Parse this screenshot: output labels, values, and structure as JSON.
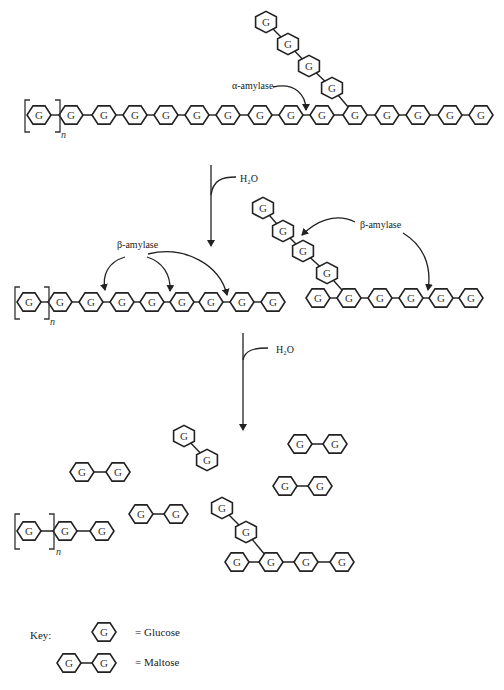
{
  "diagram": {
    "unit_label": "G",
    "repeat_subscript": "n",
    "stage1": {
      "enzyme_label": "α-amylase",
      "main_chain_units": 15,
      "bracketed_units": 1,
      "branch_units": 4
    },
    "step1_reagent": "H₂O",
    "stage2": {
      "enzyme_label_left": "β-amylase",
      "enzyme_label_right": "β-amylase",
      "left_chain_units": 9,
      "right_chain_units": 6,
      "right_branch_units": 4
    },
    "step2_reagent": "H₂O",
    "stage3": {
      "maltose_count": 5,
      "remaining_chain_units": 3,
      "limit_dextrin_chain_units": 4,
      "limit_dextrin_branch_units": 2
    },
    "key": {
      "title": "Key:",
      "glucose_label": "= Glucose",
      "maltose_label": "= Maltose"
    }
  }
}
